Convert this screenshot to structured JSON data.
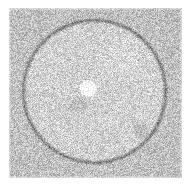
{
  "image": {
    "title": "Noisy grayscale field with circular ring and bright disks",
    "kind": "speckle-noise-micrograph",
    "width": 191,
    "height": 186,
    "background_color": "#ffffff",
    "canvas_label": "noise-field-canvas"
  },
  "field": {
    "label": "speckled-noise-field",
    "x": 9,
    "y": 8,
    "width": 173,
    "height": 170,
    "mean_gray": 198,
    "noise_amplitude": 62,
    "interior_brightness_offset": 10,
    "exterior_brightness_offset": -4
  },
  "ring": {
    "label": "dark-circular-ring",
    "center_x": 94,
    "center_y": 91,
    "radius": 71,
    "thickness": 3.4,
    "darkening": 66,
    "color": "#6e6e6e"
  },
  "blobs": [
    {
      "label": "bright-center-disk",
      "center_x": 88,
      "center_y": 88,
      "radius": 7,
      "brightness": 46,
      "softness": 2.5,
      "color": "#e8e8e8"
    },
    {
      "label": "faint-gray-disk-lower-left-of-center",
      "center_x": 78,
      "center_y": 105,
      "radius": 7,
      "brightness": -14,
      "softness": 3,
      "color": "#b4b4b4"
    },
    {
      "label": "gray-disk-lower-right",
      "center_x": 141,
      "center_y": 130,
      "radius": 6.5,
      "brightness": -18,
      "softness": 2,
      "color": "#a8a8a8"
    },
    {
      "label": "faint-halo-upper-right",
      "center_x": 120,
      "center_y": 60,
      "radius": 16,
      "brightness": 7,
      "softness": 10,
      "color": "#dcdcdc"
    }
  ],
  "margins": {
    "label": "white-page-margin",
    "top": 8,
    "left": 9,
    "right": 9,
    "bottom": 8
  }
}
